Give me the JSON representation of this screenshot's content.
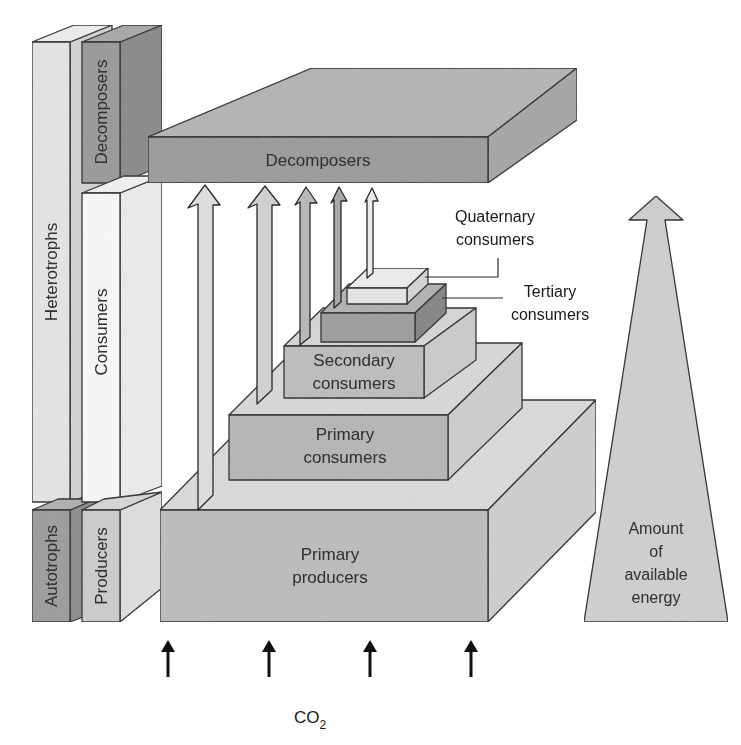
{
  "diagram": {
    "type": "trophic-energy-pyramid",
    "colors": {
      "background": "#ffffff",
      "outline": "#2a2a2a",
      "decomposer_front": "#9a9a9a",
      "decomposer_top": "#b3b3b3",
      "decomposer_side": "#a6a6a6",
      "level_front": "#b9b9b9",
      "level_top": "#d8d8d8",
      "level_side": "#cdcdcd",
      "tertiary_front": "#9e9e9e",
      "tertiary_side": "#8a8a8a",
      "quaternary_front": "#e6e6e6",
      "column_light": "#e4e4e4",
      "column_white": "#f6f6f6",
      "column_dark": "#9c9c9c",
      "energy_arrow": "#cfcfcf",
      "co2_arrow": "#111111"
    },
    "side_columns": {
      "outer": [
        {
          "label": "Heterotrophs",
          "shade": "light"
        },
        {
          "label": "Autotrophs",
          "shade": "dark"
        }
      ],
      "inner": [
        {
          "label": "Decomposers",
          "shade": "dark"
        },
        {
          "label": "Consumers",
          "shade": "white"
        },
        {
          "label": "Producers",
          "shade": "light"
        }
      ]
    },
    "decomposer_slab": {
      "label": "Decomposers"
    },
    "levels": [
      {
        "id": "primary-producers",
        "line1": "Primary",
        "line2": "producers"
      },
      {
        "id": "primary-consumers",
        "line1": "Primary",
        "line2": "consumers"
      },
      {
        "id": "secondary-consumers",
        "line1": "Secondary",
        "line2": "consumers"
      },
      {
        "id": "tertiary-consumers",
        "line1": "Tertiary",
        "line2": "consumers",
        "callout": true
      },
      {
        "id": "quaternary-consumers",
        "line1": "Quaternary",
        "line2": "consumers",
        "callout": true
      }
    ],
    "flow_arrows_to_decomposers": 5,
    "energy_arrow": {
      "lines": [
        "Amount",
        "of",
        "available",
        "energy"
      ]
    },
    "co2_input": {
      "arrow_count": 4,
      "label_main": "CO",
      "label_subscript": "2"
    }
  }
}
